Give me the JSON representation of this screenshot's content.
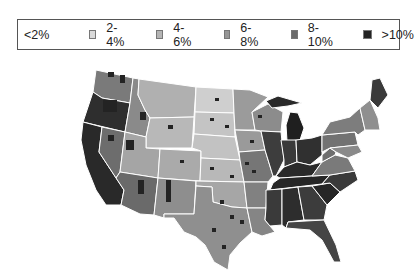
{
  "legend": {
    "items": [
      {
        "label": "<2%",
        "color": "#ffffff",
        "swatch": false
      },
      {
        "label": "2-4%",
        "color": "#d9d9d9",
        "swatch": true
      },
      {
        "label": "4-6%",
        "color": "#b4b4b4",
        "swatch": true
      },
      {
        "label": "6-8%",
        "color": "#969696",
        "swatch": true
      },
      {
        "label": "8-10%",
        "color": "#6b6b6b",
        "swatch": true
      },
      {
        "label": ">10%",
        "color": "#232323",
        "swatch": true
      }
    ]
  },
  "map": {
    "type": "choropleth",
    "region": "Contiguous United States (counties)",
    "classes": [
      "<2%",
      "2-4%",
      "4-6%",
      "6-8%",
      "8-10%",
      ">10%"
    ],
    "state_borders_color": "#ffffff"
  }
}
